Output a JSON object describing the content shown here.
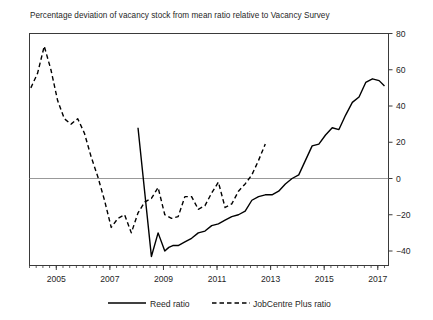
{
  "chart_data": {
    "type": "line",
    "title": "Percentage deviation of vacancy stock from mean ratio relative to Vacancy Survey",
    "xlabel": "",
    "ylabel": "",
    "xlim": [
      2004.0,
      2017.4
    ],
    "ylim": [
      -48,
      80
    ],
    "grid": false,
    "yaxis_position": "right",
    "zero_line": true,
    "legend_position": "bottom",
    "xticks": [
      2005,
      2007,
      2009,
      2011,
      2013,
      2015,
      2017
    ],
    "xtick_labels": [
      "2005",
      "2007",
      "2009",
      "2011",
      "2013",
      "2015",
      "2017"
    ],
    "xminor_tick_interval": 0.25,
    "yticks": [
      -40,
      -20,
      0,
      20,
      40,
      60,
      80
    ],
    "ytick_labels": [
      "−40",
      "−20",
      "0",
      "20",
      "40",
      "60",
      "80"
    ],
    "series": [
      {
        "name": "Reed ratio",
        "style": "solid",
        "color": "#000000",
        "x": [
          2008.05,
          2008.55,
          2008.8,
          2009.05,
          2009.2,
          2009.35,
          2009.55,
          2009.8,
          2010.05,
          2010.3,
          2010.55,
          2010.8,
          2011.05,
          2011.3,
          2011.55,
          2011.8,
          2012.05,
          2012.3,
          2012.55,
          2012.8,
          2013.05,
          2013.3,
          2013.55,
          2013.8,
          2014.05,
          2014.3,
          2014.55,
          2014.8,
          2015.05,
          2015.3,
          2015.55,
          2015.8,
          2016.05,
          2016.3,
          2016.55,
          2016.8,
          2017.05,
          2017.25
        ],
        "y": [
          28,
          -43,
          -30,
          -40,
          -38,
          -37,
          -37,
          -35,
          -33,
          -30,
          -29,
          -26,
          -25,
          -23,
          -21,
          -20,
          -18,
          -12,
          -10,
          -9,
          -9,
          -7,
          -3,
          0,
          2,
          10,
          18,
          19,
          24,
          28,
          27,
          35,
          42,
          45,
          53,
          55,
          54,
          51
        ]
      },
      {
        "name": "JobCentre Plus ratio",
        "style": "dashed",
        "color": "#000000",
        "x": [
          2004.05,
          2004.3,
          2004.55,
          2004.8,
          2005.05,
          2005.3,
          2005.55,
          2005.8,
          2006.05,
          2006.3,
          2006.55,
          2006.8,
          2007.05,
          2007.3,
          2007.55,
          2007.8,
          2008.05,
          2008.3,
          2008.55,
          2008.8,
          2009.05,
          2009.3,
          2009.55,
          2009.8,
          2010.05,
          2010.3,
          2010.55,
          2010.8,
          2011.05,
          2011.3,
          2011.55,
          2011.8,
          2012.05,
          2012.3,
          2012.55,
          2012.8
        ],
        "y": [
          50,
          58,
          73,
          60,
          43,
          33,
          30,
          33,
          25,
          12,
          1,
          -12,
          -27,
          -22,
          -20,
          -30,
          -19,
          -13,
          -11,
          -5,
          -20,
          -22,
          -21,
          -10,
          -10,
          -17,
          -15,
          -8,
          -2,
          -16,
          -14,
          -7,
          -3,
          2,
          10,
          19
        ]
      }
    ]
  },
  "legend": {
    "reed_label": "Reed ratio",
    "jcp_label": "JobCentre Plus ratio"
  }
}
